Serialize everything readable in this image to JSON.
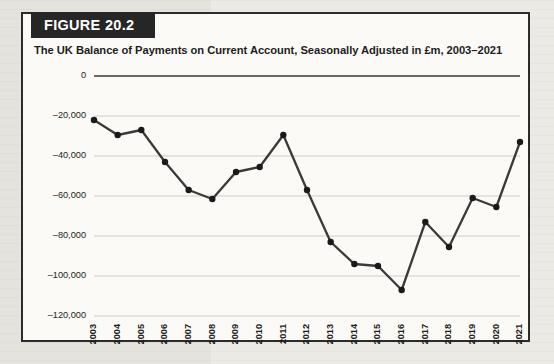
{
  "figure": {
    "badge_label": "FIGURE 20.2",
    "title": "The UK Balance of Payments on Current Account, Seasonally Adjusted in £m, 2003–2021"
  },
  "colors": {
    "badge_background": "#262626",
    "badge_text": "#ffffff",
    "figure_border": "#2b2b2b",
    "figure_background": "#fbfaf7",
    "page_background": "#eceae4",
    "series": "#3a3a3a",
    "gridline": "#cfcdc8",
    "zero_axis": "#3a3a3a"
  },
  "chart_data": {
    "type": "line",
    "title": "The UK Balance of Payments on Current Account, Seasonally Adjusted in £m, 2003–2021",
    "xlabel": "",
    "ylabel": "",
    "grid": true,
    "legend": "none",
    "categories": [
      "2003",
      "2004",
      "2005",
      "2006",
      "2007",
      "2008",
      "2009",
      "2010",
      "2011",
      "2012",
      "2013",
      "2014",
      "2015",
      "2016",
      "2017",
      "2018",
      "2019",
      "2020",
      "2021"
    ],
    "values": [
      -22000,
      -29500,
      -27000,
      -43000,
      -57000,
      -61500,
      -48000,
      -45500,
      -29500,
      -57000,
      -83000,
      -94000,
      -95000,
      -107000,
      -73000,
      -85500,
      -61000,
      -65500,
      -33000
    ],
    "ylim": [
      -120000,
      0
    ],
    "yticks": [
      0,
      -20000,
      -40000,
      -60000,
      -80000,
      -100000,
      -120000
    ],
    "ytick_labels": [
      "0",
      "–20,000",
      "–40,000",
      "–60,000",
      "–80,000",
      "–100,000",
      "–120,000"
    ],
    "xtick_labels": [
      "2003",
      "2004",
      "2005",
      "2006",
      "2007",
      "2008",
      "2009",
      "2010",
      "2011",
      "2012",
      "2013",
      "2014",
      "2015",
      "2016",
      "2017",
      "2018",
      "2019",
      "2020",
      "2021"
    ]
  }
}
